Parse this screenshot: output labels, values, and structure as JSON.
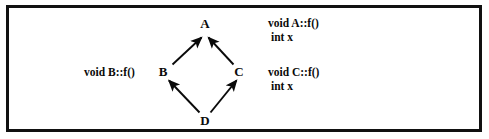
{
  "figure": {
    "kind": "class-inheritance-diamond-diagram",
    "background_color": "#ffffff",
    "border_color": "#111111",
    "ink_color": "#0a0a0a"
  },
  "nodes": [
    {
      "id": "A",
      "label": "A",
      "x": 205,
      "y": 23,
      "role": "base-class"
    },
    {
      "id": "B",
      "label": "B",
      "x": 163,
      "y": 71,
      "role": "derived-class"
    },
    {
      "id": "C",
      "label": "C",
      "x": 239,
      "y": 71,
      "role": "derived-class"
    },
    {
      "id": "D",
      "label": "D",
      "x": 205,
      "y": 120,
      "role": "most-derived-class"
    }
  ],
  "edges": [
    {
      "from": "B",
      "to": "A",
      "arrow": "to-base"
    },
    {
      "from": "C",
      "to": "A",
      "arrow": "to-base"
    },
    {
      "from": "D",
      "to": "B",
      "arrow": "to-base"
    },
    {
      "from": "D",
      "to": "C",
      "arrow": "to-base"
    }
  ],
  "annotations": {
    "a": {
      "method": "void A::f()",
      "member": "int x"
    },
    "b": {
      "method": "void B::f()"
    },
    "c": {
      "method": "void C::f()",
      "member": "int x"
    }
  }
}
